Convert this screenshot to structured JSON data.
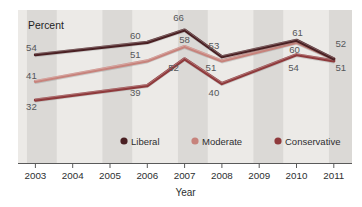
{
  "chart_data": {
    "type": "line",
    "title": "",
    "xlabel": "Year",
    "ylabel": "Percent",
    "x": [
      2003,
      2006,
      2007,
      2008,
      2010,
      2011
    ],
    "x_ticks": [
      2003,
      2004,
      2005,
      2006,
      2007,
      2008,
      2009,
      2010,
      2011
    ],
    "ylim": [
      25,
      72
    ],
    "grid": "vertical-alternating-bands",
    "legend_position": "bottom",
    "series": [
      {
        "name": "Liberal",
        "color": "#4a2023",
        "values": [
          54,
          60,
          66,
          53,
          61,
          52
        ]
      },
      {
        "name": "Moderate",
        "color": "#c7837c",
        "values": [
          41,
          51,
          58,
          51,
          60,
          52
        ]
      },
      {
        "name": "Conservative",
        "color": "#8f3a3c",
        "values": [
          32,
          39,
          52,
          40,
          54,
          51
        ]
      }
    ],
    "point_labels_visible": [
      54,
      41,
      32,
      60,
      51,
      39,
      66,
      58,
      52,
      53,
      51,
      40,
      61,
      60,
      54,
      52,
      51
    ],
    "band_colors": {
      "light": "#eceae7",
      "dark": "#dbd9d6"
    }
  }
}
